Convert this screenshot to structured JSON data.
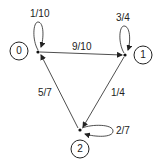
{
  "nodes": [
    {
      "id": "0",
      "label": "0"
    },
    {
      "id": "1",
      "label": "1"
    },
    {
      "id": "2",
      "label": "2"
    }
  ],
  "edges": [
    {
      "from": "0",
      "to": "0",
      "label": "1/10"
    },
    {
      "from": "0",
      "to": "1",
      "label": "9/10"
    },
    {
      "from": "1",
      "to": "1",
      "label": "3/4"
    },
    {
      "from": "1",
      "to": "2",
      "label": "1/4"
    },
    {
      "from": "2",
      "to": "2",
      "label": "2/7"
    },
    {
      "from": "2",
      "to": "0",
      "label": "5/7"
    }
  ],
  "colors": {
    "stroke": "#222222",
    "background": "#ffffff"
  }
}
